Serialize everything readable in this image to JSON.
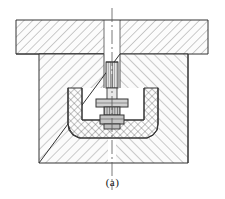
{
  "figure": {
    "caption": "(a)",
    "title": "",
    "type": "engineering-cross-section"
  },
  "colors": {
    "outline": "#333333",
    "hatch": "#666666",
    "centerline": "#555555",
    "background": "#ffffff",
    "fill_light": "#fbfbfb",
    "fill_rod": "#d9d9d9",
    "fill_nut": "#b8b8b8"
  },
  "parts": [
    {
      "id": "top-plate",
      "label": "Upper plate",
      "hatch": "45",
      "note": "spans full width at top, notched at center for rod"
    },
    {
      "id": "die-block",
      "label": "Lower die block",
      "hatch": "45/135",
      "note": "hatched left up-right, right up-left"
    },
    {
      "id": "insert-cup",
      "label": "U-shaped insert cavity",
      "hatch": "cross",
      "note": "cross hatched cup inside die block"
    },
    {
      "id": "punch-rod",
      "label": "Punch rod",
      "hatch": "none",
      "note": "vertical rod on axis"
    },
    {
      "id": "threaded-section",
      "label": "Threaded section",
      "hatch": "none",
      "note": "fine vertical lines on rod"
    },
    {
      "id": "upper-nut",
      "label": "Upper nut / collar",
      "hatch": "none",
      "note": "wide flange below rod"
    },
    {
      "id": "lower-nut",
      "label": "Lower nut",
      "hatch": "none",
      "note": "small block at bottom of stack"
    },
    {
      "id": "center-line",
      "label": "Axis centre line",
      "hatch": "none",
      "note": "dash-dot vertical axis"
    }
  ],
  "geometry": {
    "top_plate": {
      "x": 16,
      "y": 20,
      "w": 192,
      "h": 34
    },
    "die_block": {
      "x": 39,
      "y": 54,
      "w": 149,
      "h": 109
    },
    "axis_x": 112,
    "axis_top": 8,
    "axis_bottom": 190
  }
}
